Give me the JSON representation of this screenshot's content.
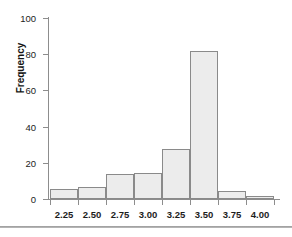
{
  "chart_data": {
    "type": "bar",
    "title": "",
    "subtitle": "",
    "xlabel": "",
    "ylabel": "Frequency",
    "categories": [
      "2.25",
      "2.50",
      "2.75",
      "3.00",
      "3.25",
      "3.50",
      "3.75",
      "4.00"
    ],
    "values": [
      5,
      6,
      13,
      14,
      27,
      81,
      4,
      1
    ],
    "xtick_labels": [
      "2.25",
      "2.50",
      "2.75",
      "3.00",
      "3.25",
      "3.50",
      "3.75",
      "4.00"
    ],
    "ytick_labels": [
      "0",
      "20",
      "40",
      "60",
      "80",
      "100"
    ],
    "ytick_values": [
      0,
      20,
      40,
      60,
      80,
      100
    ],
    "ylim": [
      0,
      100
    ],
    "grid": false,
    "legend": false,
    "bar_fill_color": "#ececec",
    "bar_edge_color": "#8a8a8a",
    "axis_color": "#8d8d8d",
    "text_color": "#1c1c1c",
    "background_color": "#ffffff"
  },
  "axes": {
    "y_axis_title": "Frequency"
  }
}
